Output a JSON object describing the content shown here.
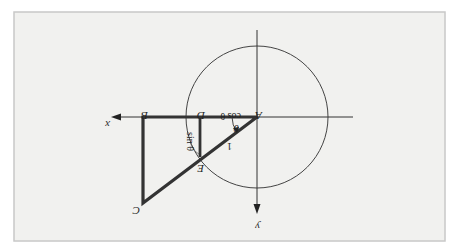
{
  "figure": {
    "orientation": "rotated 180 degrees",
    "points": {
      "A": "A",
      "B": "B",
      "C": "C",
      "D": "D",
      "E": "E"
    },
    "axes": {
      "x_label": "x",
      "y_label": "y"
    },
    "labels": {
      "cos": "cos θ",
      "sin": "sin θ",
      "theta": "θ",
      "hyp": "1"
    },
    "colors": {
      "background": "#ffffff",
      "panel": "#f1f1ef",
      "border": "#c8c8c8",
      "ink": "#222222"
    }
  }
}
